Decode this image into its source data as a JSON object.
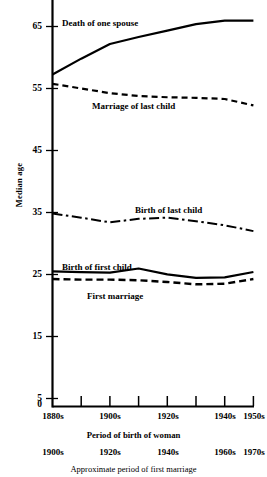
{
  "chart_data": {
    "type": "line",
    "title": "",
    "xlabel": "Period of birth of woman",
    "xlabel2": "Approximate period of first marriage",
    "ylabel": "Median age",
    "ylim": [
      0,
      70
    ],
    "yticks": [
      0,
      5,
      15,
      25,
      35,
      45,
      55,
      65
    ],
    "ytick_labels": [
      "0",
      "5",
      "15",
      "25",
      "35",
      "45",
      "55",
      "65"
    ],
    "grid": false,
    "legend_position": "inline-annotations",
    "x": [
      "1880s",
      "1890s",
      "1900s",
      "1910s",
      "1920s",
      "1930s",
      "1940s",
      "1950s"
    ],
    "xtick_labels": [
      "1880s",
      "1900s",
      "1920s",
      "1940s",
      "1950s"
    ],
    "xtick_labels2": [
      "1900s",
      "1920s",
      "1940s",
      "1960s",
      "1970s"
    ],
    "series": [
      {
        "name": "Death of one spouse",
        "style": "solid",
        "values": [
          56.8,
          59.5,
          62.0,
          63.2,
          64.3,
          65.4,
          66.0,
          66.0
        ]
      },
      {
        "name": "Marriage of last child",
        "style": "dashed",
        "values": [
          55.2,
          54.4,
          53.6,
          53.1,
          52.9,
          52.8,
          52.6,
          51.5
        ]
      },
      {
        "name": "Birth of last child",
        "style": "dash-dot",
        "values": [
          33.0,
          32.3,
          31.5,
          32.1,
          32.3,
          31.7,
          31.0,
          30.0
        ]
      },
      {
        "name": "Birth of first child",
        "style": "solid",
        "values": [
          23.1,
          23.0,
          22.9,
          23.6,
          22.6,
          22.0,
          22.1,
          23.0
        ]
      },
      {
        "name": "First marriage",
        "style": "dashed",
        "values": [
          21.8,
          21.7,
          21.7,
          21.6,
          21.3,
          20.9,
          21.0,
          21.8
        ]
      }
    ]
  },
  "labels": {
    "death_of_one_spouse": "Death of one spouse",
    "marriage_of_last_child": "Marriage of last child",
    "birth_of_last_child": "Birth of last child",
    "birth_of_first_child": "Birth of first child",
    "first_marriage": "First marriage",
    "y_axis_title": "Median age",
    "x_axis_title": "Period of birth of woman",
    "x_axis_title2": "Approximate period of first marriage"
  },
  "yticks": {
    "t0": "0",
    "t1": "5",
    "t2": "15",
    "t3": "25",
    "t4": "35",
    "t5": "45",
    "t6": "55",
    "t7": "65"
  },
  "xticks": {
    "a0": "1880s",
    "a1": "1900s",
    "a2": "1920s",
    "a3": "1940s",
    "a4": "1950s",
    "b0": "1900s",
    "b1": "1920s",
    "b2": "1940s",
    "b3": "1960s",
    "b4": "1970s"
  },
  "colors": {
    "line": "#000000",
    "axis": "#000000",
    "background": "#ffffff"
  }
}
